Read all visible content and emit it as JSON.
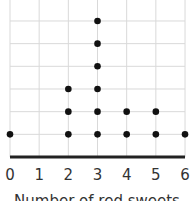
{
  "chart_data": {
    "type": "scatter",
    "subtype": "dot_plot",
    "title": "",
    "xlabel": "Number of red sweets",
    "ylabel": "",
    "categories": [
      0,
      1,
      2,
      3,
      4,
      5,
      6
    ],
    "values": [
      1,
      0,
      3,
      6,
      2,
      2,
      1
    ],
    "xlim": [
      0,
      6
    ],
    "grid": true,
    "legend": null
  },
  "axis": {
    "xlabel": "Number of red sweets",
    "ticks": [
      "0",
      "1",
      "2",
      "3",
      "4",
      "5",
      "6"
    ]
  },
  "colors": {
    "dot": "#111111",
    "grid": "#d9d9d9",
    "axis": "#222222",
    "text": "#333333"
  }
}
